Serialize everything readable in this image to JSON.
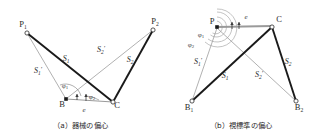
{
  "figure": {
    "panels": [
      {
        "id": "a",
        "caption": "（a）器械の偏心",
        "points": [
          {
            "name": "P1",
            "label": "P",
            "sub": "1",
            "x": 23,
            "y": 27
          },
          {
            "name": "P2",
            "label": "P",
            "sub": "2",
            "x": 155,
            "y": 24
          },
          {
            "name": "B",
            "label": "B",
            "sub": "",
            "x": 62,
            "y": 101
          },
          {
            "name": "C",
            "label": "C",
            "sub": "",
            "x": 110,
            "y": 105
          }
        ],
        "distances": [
          {
            "name": "S1",
            "label": "S",
            "sub": "1",
            "prime": false,
            "x": 66,
            "y": 61
          },
          {
            "name": "S1p",
            "label": "S",
            "sub": "1",
            "prime": true,
            "x": 38,
            "y": 73
          },
          {
            "name": "S2p",
            "label": "S",
            "sub": "2",
            "prime": true,
            "x": 101,
            "y": 52
          },
          {
            "name": "S2",
            "label": "S",
            "sub": "2",
            "prime": false,
            "x": 129,
            "y": 62
          }
        ],
        "angles": [
          {
            "name": "phi1",
            "label": "φ",
            "sub": "1",
            "x": 65,
            "y": 86
          },
          {
            "name": "phi2",
            "label": "φ",
            "sub": "2",
            "x": 90,
            "y": 98
          },
          {
            "name": "eps",
            "label": "e",
            "sub": "",
            "x": 84,
            "y": 110
          }
        ]
      },
      {
        "id": "b",
        "caption": "（b）視標準の偏心",
        "points": [
          {
            "name": "P",
            "label": "P",
            "sub": "",
            "x": 214,
            "y": 23
          },
          {
            "name": "C",
            "label": "C",
            "sub": "",
            "x": 274,
            "y": 21
          },
          {
            "name": "B1",
            "label": "B",
            "sub": "1",
            "x": 188,
            "y": 105
          },
          {
            "name": "B2",
            "label": "B",
            "sub": "2",
            "x": 299,
            "y": 105
          }
        ],
        "distances": [
          {
            "name": "S1p",
            "label": "S",
            "sub": "1",
            "prime": true,
            "x": 198,
            "y": 63
          },
          {
            "name": "S1",
            "label": "S",
            "sub": "1",
            "prime": false,
            "x": 224,
            "y": 77
          },
          {
            "name": "S2p",
            "label": "S",
            "sub": "2",
            "prime": true,
            "x": 259,
            "y": 76
          },
          {
            "name": "S2",
            "label": "S",
            "sub": "2",
            "prime": false,
            "x": 287,
            "y": 63
          }
        ],
        "angles": [
          {
            "name": "phi1",
            "label": "φ",
            "sub": "1",
            "x": 199,
            "y": 35
          },
          {
            "name": "phi2",
            "label": "φ",
            "sub": "2",
            "x": 190,
            "y": 46
          },
          {
            "name": "eps",
            "label": "e",
            "sub": "",
            "x": 243,
            "y": 17
          }
        ]
      }
    ],
    "colors": {
      "heavy_line": "#1a1a1a",
      "light_line": "#8f8f8f",
      "text": "#2b2b2b",
      "background": "#ffffff"
    }
  }
}
